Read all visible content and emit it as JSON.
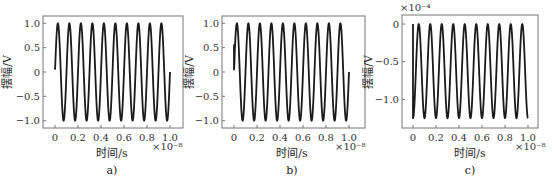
{
  "chart_data": [
    {
      "type": "line",
      "panel": "a)",
      "title": "",
      "caption": "a)",
      "xlabel": "时间/s",
      "ylabel": "摆幅/V",
      "x_multiplier": "×10⁻⁸",
      "y_multiplier": "",
      "xlim": [
        0,
        1.0
      ],
      "ylim": [
        -1.15,
        1.15
      ],
      "xticks": [
        "0",
        "0.2",
        "0.4",
        "0.6",
        "0.8",
        "1.0"
      ],
      "yticks": [
        "1.0",
        "0.5",
        "0",
        "−0.5",
        "−1.0"
      ],
      "ytick_values": [
        1.0,
        0.5,
        0,
        -0.5,
        -1.0
      ],
      "grid": false,
      "series": [
        {
          "name": "signal",
          "function": "sin",
          "amplitude": 1.0,
          "offset": 0,
          "cycles": 10,
          "phase_cycles": 0.0,
          "start_jump": null,
          "x": [
            0,
            0.025,
            0.075,
            0.125,
            0.175,
            0.225,
            0.275,
            0.325,
            0.375,
            0.425,
            0.475,
            0.525,
            0.575,
            0.625,
            0.675,
            0.725,
            0.775,
            0.825,
            0.875,
            0.925,
            0.975,
            1.0
          ],
          "values": [
            0.05,
            1.0,
            -1.0,
            1.0,
            -1.0,
            1.0,
            -1.0,
            1.0,
            -1.0,
            1.0,
            -1.0,
            1.0,
            -1.0,
            1.0,
            -1.0,
            1.0,
            -1.0,
            1.0,
            -1.0,
            1.0,
            -1.0,
            -0.1
          ]
        }
      ]
    },
    {
      "type": "line",
      "panel": "b)",
      "title": "",
      "caption": "b)",
      "xlabel": "时间/s",
      "ylabel": "摆幅/V",
      "x_multiplier": "×10⁻⁸",
      "y_multiplier": "",
      "xlim": [
        0,
        1.0
      ],
      "ylim": [
        -1.15,
        1.15
      ],
      "xticks": [
        "0",
        "0.2",
        "0.4",
        "0.6",
        "0.8",
        "1.0"
      ],
      "yticks": [
        "1.0",
        "0.5",
        "0",
        "−0.5",
        "−1.0"
      ],
      "ytick_values": [
        1.0,
        0.5,
        0,
        -0.5,
        -1.0
      ],
      "grid": false,
      "series": [
        {
          "name": "signal",
          "function": "sin",
          "amplitude": 1.0,
          "offset": 0,
          "cycles": 10,
          "phase_cycles": 0.0,
          "start_jump": [
            0.05,
            0.55
          ],
          "x": [
            0,
            0.025,
            0.075,
            0.125,
            0.175,
            0.225,
            0.275,
            0.325,
            0.375,
            0.425,
            0.475,
            0.525,
            0.575,
            0.625,
            0.675,
            0.725,
            0.775,
            0.825,
            0.875,
            0.925,
            0.975,
            1.0
          ],
          "values": [
            0.05,
            1.0,
            -1.0,
            1.0,
            -1.0,
            1.0,
            -1.0,
            1.0,
            -1.0,
            1.0,
            -1.0,
            1.0,
            -1.0,
            1.0,
            -1.0,
            1.0,
            -1.0,
            1.0,
            -1.0,
            1.0,
            -1.0,
            -0.1
          ]
        }
      ]
    },
    {
      "type": "line",
      "panel": "c)",
      "title": "",
      "caption": "c)",
      "xlabel": "时间/s",
      "ylabel": "摆幅/V",
      "x_multiplier": "×10⁻⁸",
      "y_multiplier": "×10⁻⁴",
      "xlim": [
        0,
        1.0
      ],
      "ylim": [
        -1.38,
        0.12
      ],
      "xticks": [
        "0",
        "0.2",
        "0.4",
        "0.6",
        "0.8",
        "1.0"
      ],
      "yticks": [
        "0",
        "−0.5",
        "−1.0"
      ],
      "ytick_values": [
        0,
        -0.5,
        -1.0
      ],
      "grid": false,
      "series": [
        {
          "name": "signal",
          "function": "raised-cos",
          "amplitude": 0.625,
          "offset": -0.625,
          "cycles": 10,
          "phase_cycles": 0.25,
          "start_jump": [
            0,
            -1.25
          ],
          "x": [
            0,
            0.005,
            0.05,
            0.1,
            0.15,
            0.2,
            0.25,
            0.3,
            0.35,
            0.4,
            0.45,
            0.5,
            0.55,
            0.6,
            0.65,
            0.7,
            0.75,
            0.8,
            0.85,
            0.9,
            0.95,
            1.0
          ],
          "values": [
            0,
            -1.25,
            0,
            -1.25,
            0,
            -1.25,
            0,
            -1.25,
            0,
            -1.25,
            0,
            -1.25,
            0,
            -1.25,
            0,
            -1.25,
            0,
            -1.25,
            0,
            -1.25,
            0,
            -1.25
          ]
        }
      ]
    }
  ],
  "panels": [
    {
      "frame": [
        43,
        16,
        183,
        128
      ],
      "x0px": 55,
      "x1px": 170
    },
    {
      "frame": [
        222,
        16,
        365,
        128
      ],
      "x0px": 234,
      "x1px": 349
    },
    {
      "frame": [
        402,
        15,
        538,
        128
      ],
      "x0px": 413,
      "x1px": 528
    }
  ]
}
